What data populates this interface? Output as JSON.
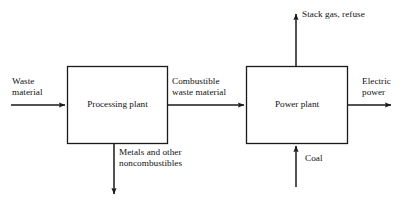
{
  "diagram": {
    "type": "block-flow-diagram",
    "background_color": "#ffffff",
    "line_color": "#1a1a1a",
    "text_color": "#111111",
    "blocks": [
      {
        "id": "processing-plant",
        "label": "Processing plant",
        "x": 67,
        "y": 66,
        "width": 101,
        "height": 78
      },
      {
        "id": "power-plant",
        "label": "Power plant",
        "x": 246,
        "y": 66,
        "width": 102,
        "height": 78
      }
    ],
    "streams": [
      {
        "id": "waste-material",
        "label": "Waste\nmaterial",
        "label_line1": "Waste",
        "label_line2": "material",
        "direction": "right",
        "from": "left-edge",
        "to": "processing-plant"
      },
      {
        "id": "combustible-waste-material",
        "label": "Combustible\nwaste material",
        "label_line1": "Combustible",
        "label_line2": "waste material",
        "direction": "right",
        "from": "processing-plant",
        "to": "power-plant"
      },
      {
        "id": "metals-noncombustibles",
        "label": "Metals and other\nnoncombustibles",
        "label_line1": "Metals and other",
        "label_line2": "noncombustibles",
        "direction": "down",
        "from": "processing-plant",
        "to": "out"
      },
      {
        "id": "stack-gas-refuse",
        "label": "Stack gas, refuse",
        "direction": "up",
        "from": "power-plant",
        "to": "out"
      },
      {
        "id": "coal",
        "label": "Coal",
        "direction": "up",
        "from": "in",
        "to": "power-plant"
      },
      {
        "id": "electric-power",
        "label": "Electric\npower",
        "label_line1": "Electric",
        "label_line2": "power",
        "direction": "right",
        "from": "power-plant",
        "to": "out"
      }
    ]
  }
}
